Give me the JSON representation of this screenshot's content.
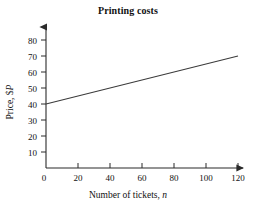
{
  "chart_data": {
    "type": "line",
    "title": "Printing costs",
    "xlabel_prefix": "Number of tickets, ",
    "xlabel_var": "n",
    "ylabel_prefix": "Price, $",
    "ylabel_var": "P",
    "xlabel": "Number of tickets, n",
    "ylabel": "Price, $P",
    "x": [
      0,
      120
    ],
    "values": [
      40,
      70
    ],
    "series": [
      {
        "name": "Printing cost",
        "x": [
          0,
          120
        ],
        "values": [
          40,
          70
        ]
      }
    ],
    "equation": "P = 40 + 0.25n",
    "xlim": [
      0,
      130
    ],
    "ylim": [
      0,
      88
    ],
    "xticks": [
      0,
      20,
      40,
      60,
      80,
      100,
      120
    ],
    "xtick_labels": [
      "0",
      "20",
      "40",
      "60",
      "80",
      "100",
      "120"
    ],
    "yticks": [
      10,
      20,
      30,
      40,
      50,
      60,
      70,
      80
    ],
    "ytick_labels": [
      "10",
      "20",
      "30",
      "40",
      "50",
      "60",
      "70",
      "80"
    ],
    "origin_label": "0",
    "grid": false,
    "legend": false,
    "axis_arrows": true,
    "line_color": "#3a3a3a",
    "axis_color": "#2b2b2b",
    "background": "#ffffff"
  }
}
